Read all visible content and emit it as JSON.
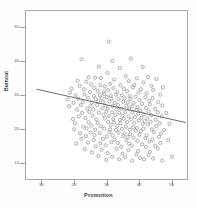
{
  "chart_data": {
    "type": "scatter",
    "title": "",
    "xlabel": "Promotion",
    "ylabel": "Burnout",
    "xlim": [
      5,
      55
    ],
    "ylim": [
      5,
      55
    ],
    "xticks": [
      10,
      20,
      30,
      40,
      50
    ],
    "yticks": [
      10,
      20,
      30,
      40,
      50
    ],
    "grid": false,
    "legend": null,
    "marker": "open-circle",
    "marker_color": "#8c8c8c",
    "trendline": {
      "type": "linear-fit",
      "color": "#6e6e6e",
      "x_start": 8.2,
      "y_start": 32.0,
      "x_end": 54.0,
      "y_end": 22.2
    },
    "points": [
      [
        30.4,
        46.0
      ],
      [
        22.0,
        40.8
      ],
      [
        31.5,
        40.3
      ],
      [
        37.2,
        41.0
      ],
      [
        27.3,
        38.6
      ],
      [
        33.8,
        38.2
      ],
      [
        40.8,
        38.5
      ],
      [
        30.0,
        36.8
      ],
      [
        24.2,
        35.5
      ],
      [
        26.2,
        35.4
      ],
      [
        28.0,
        35.3
      ],
      [
        35.6,
        35.8
      ],
      [
        39.0,
        35.2
      ],
      [
        42.4,
        35.6
      ],
      [
        45.0,
        35.0
      ],
      [
        20.8,
        34.5
      ],
      [
        23.5,
        34.2
      ],
      [
        32.0,
        34.8
      ],
      [
        36.5,
        34.4
      ],
      [
        41.0,
        34.0
      ],
      [
        21.5,
        33.0
      ],
      [
        25.0,
        33.4
      ],
      [
        27.8,
        33.2
      ],
      [
        30.8,
        33.6
      ],
      [
        34.0,
        33.1
      ],
      [
        38.2,
        33.3
      ],
      [
        43.5,
        33.0
      ],
      [
        47.0,
        32.5
      ],
      [
        19.0,
        32.2
      ],
      [
        22.8,
        32.0
      ],
      [
        26.0,
        32.4
      ],
      [
        29.2,
        32.8
      ],
      [
        31.8,
        32.3
      ],
      [
        35.0,
        32.1
      ],
      [
        37.8,
        32.6
      ],
      [
        40.2,
        32.0
      ],
      [
        44.0,
        31.8
      ],
      [
        18.5,
        31.0
      ],
      [
        24.6,
        31.2
      ],
      [
        27.0,
        31.5
      ],
      [
        28.8,
        31.3
      ],
      [
        30.2,
        31.7
      ],
      [
        33.0,
        31.1
      ],
      [
        36.0,
        31.4
      ],
      [
        39.5,
        31.0
      ],
      [
        42.0,
        30.8
      ],
      [
        46.2,
        30.4
      ],
      [
        20.2,
        30.2
      ],
      [
        23.0,
        30.5
      ],
      [
        25.8,
        30.0
      ],
      [
        27.6,
        30.3
      ],
      [
        29.0,
        30.6
      ],
      [
        31.0,
        30.1
      ],
      [
        32.6,
        30.4
      ],
      [
        34.4,
        30.2
      ],
      [
        36.8,
        30.0
      ],
      [
        38.6,
        29.8
      ],
      [
        41.6,
        29.6
      ],
      [
        43.8,
        29.4
      ],
      [
        17.8,
        29.0
      ],
      [
        21.0,
        29.2
      ],
      [
        24.0,
        29.5
      ],
      [
        26.4,
        29.1
      ],
      [
        28.2,
        29.4
      ],
      [
        29.8,
        29.7
      ],
      [
        31.2,
        29.2
      ],
      [
        33.4,
        29.0
      ],
      [
        35.2,
        29.3
      ],
      [
        37.0,
        29.1
      ],
      [
        39.8,
        28.8
      ],
      [
        42.8,
        28.6
      ],
      [
        45.6,
        28.2
      ],
      [
        19.6,
        28.0
      ],
      [
        22.4,
        28.3
      ],
      [
        25.2,
        28.1
      ],
      [
        27.2,
        28.5
      ],
      [
        28.6,
        28.2
      ],
      [
        30.6,
        28.4
      ],
      [
        32.2,
        28.0
      ],
      [
        34.8,
        28.3
      ],
      [
        36.2,
        28.1
      ],
      [
        38.0,
        27.9
      ],
      [
        40.6,
        27.7
      ],
      [
        43.0,
        27.5
      ],
      [
        46.8,
        27.2
      ],
      [
        18.2,
        27.0
      ],
      [
        21.8,
        27.3
      ],
      [
        24.8,
        27.1
      ],
      [
        26.8,
        27.4
      ],
      [
        29.4,
        27.2
      ],
      [
        31.6,
        27.0
      ],
      [
        33.2,
        27.3
      ],
      [
        35.8,
        27.1
      ],
      [
        37.4,
        26.9
      ],
      [
        39.2,
        26.7
      ],
      [
        41.8,
        26.5
      ],
      [
        44.6,
        26.2
      ],
      [
        20.6,
        26.0
      ],
      [
        23.8,
        26.3
      ],
      [
        25.6,
        26.1
      ],
      [
        28.4,
        26.4
      ],
      [
        30.0,
        26.2
      ],
      [
        32.8,
        26.0
      ],
      [
        34.2,
        26.3
      ],
      [
        36.6,
        26.1
      ],
      [
        38.8,
        25.9
      ],
      [
        40.0,
        25.7
      ],
      [
        42.6,
        25.5
      ],
      [
        45.4,
        25.2
      ],
      [
        48.0,
        25.0
      ],
      [
        22.2,
        25.0
      ],
      [
        24.4,
        25.3
      ],
      [
        27.4,
        25.1
      ],
      [
        29.6,
        25.4
      ],
      [
        31.4,
        25.2
      ],
      [
        33.6,
        25.0
      ],
      [
        35.4,
        25.3
      ],
      [
        37.6,
        25.1
      ],
      [
        39.4,
        24.8
      ],
      [
        41.2,
        24.6
      ],
      [
        43.4,
        24.4
      ],
      [
        46.6,
        24.0
      ],
      [
        21.2,
        24.0
      ],
      [
        25.4,
        24.2
      ],
      [
        28.8,
        24.5
      ],
      [
        30.4,
        24.1
      ],
      [
        32.4,
        24.4
      ],
      [
        34.6,
        24.2
      ],
      [
        36.4,
        24.0
      ],
      [
        38.4,
        23.8
      ],
      [
        40.4,
        23.6
      ],
      [
        42.2,
        23.4
      ],
      [
        44.8,
        23.0
      ],
      [
        19.4,
        23.2
      ],
      [
        23.2,
        23.5
      ],
      [
        26.6,
        23.1
      ],
      [
        29.2,
        23.4
      ],
      [
        31.8,
        23.2
      ],
      [
        33.8,
        23.0
      ],
      [
        35.0,
        23.3
      ],
      [
        37.2,
        23.1
      ],
      [
        39.6,
        22.8
      ],
      [
        41.4,
        22.6
      ],
      [
        43.2,
        22.4
      ],
      [
        46.0,
        22.0
      ],
      [
        49.0,
        21.8
      ],
      [
        20.0,
        22.0
      ],
      [
        24.2,
        22.3
      ],
      [
        27.0,
        22.1
      ],
      [
        30.2,
        22.4
      ],
      [
        32.0,
        22.2
      ],
      [
        34.0,
        22.0
      ],
      [
        36.0,
        22.3
      ],
      [
        38.2,
        22.1
      ],
      [
        40.8,
        21.8
      ],
      [
        42.4,
        21.6
      ],
      [
        45.0,
        21.2
      ],
      [
        22.6,
        21.0
      ],
      [
        25.0,
        21.3
      ],
      [
        28.0,
        21.1
      ],
      [
        31.0,
        21.4
      ],
      [
        33.0,
        21.2
      ],
      [
        35.6,
        21.0
      ],
      [
        37.8,
        20.8
      ],
      [
        39.0,
        20.6
      ],
      [
        41.0,
        20.4
      ],
      [
        43.6,
        20.2
      ],
      [
        47.4,
        20.0
      ],
      [
        19.8,
        20.2
      ],
      [
        23.6,
        20.5
      ],
      [
        26.2,
        20.1
      ],
      [
        29.0,
        20.4
      ],
      [
        30.8,
        20.2
      ],
      [
        32.6,
        20.0
      ],
      [
        34.4,
        20.3
      ],
      [
        36.8,
        20.1
      ],
      [
        38.6,
        19.8
      ],
      [
        40.2,
        19.6
      ],
      [
        44.2,
        19.4
      ],
      [
        46.4,
        19.0
      ],
      [
        21.6,
        19.0
      ],
      [
        24.8,
        19.3
      ],
      [
        27.6,
        19.1
      ],
      [
        30.6,
        19.4
      ],
      [
        33.4,
        19.2
      ],
      [
        35.2,
        19.0
      ],
      [
        37.0,
        18.8
      ],
      [
        39.8,
        18.6
      ],
      [
        42.0,
        18.4
      ],
      [
        45.8,
        18.0
      ],
      [
        23.4,
        18.2
      ],
      [
        26.0,
        18.5
      ],
      [
        29.8,
        18.1
      ],
      [
        31.6,
        18.4
      ],
      [
        34.8,
        18.2
      ],
      [
        36.2,
        18.0
      ],
      [
        38.0,
        17.8
      ],
      [
        41.6,
        17.6
      ],
      [
        43.8,
        17.2
      ],
      [
        48.6,
        17.0
      ],
      [
        22.0,
        17.4
      ],
      [
        25.8,
        17.1
      ],
      [
        28.6,
        17.4
      ],
      [
        32.2,
        17.2
      ],
      [
        35.8,
        17.0
      ],
      [
        39.2,
        16.8
      ],
      [
        42.8,
        16.6
      ],
      [
        46.2,
        16.2
      ],
      [
        20.4,
        16.0
      ],
      [
        24.0,
        16.3
      ],
      [
        27.8,
        16.1
      ],
      [
        31.2,
        16.4
      ],
      [
        33.2,
        16.2
      ],
      [
        36.6,
        16.0
      ],
      [
        40.6,
        15.8
      ],
      [
        44.6,
        15.4
      ],
      [
        26.4,
        15.2
      ],
      [
        29.4,
        15.5
      ],
      [
        34.2,
        15.1
      ],
      [
        37.4,
        15.4
      ],
      [
        41.8,
        15.0
      ],
      [
        45.4,
        14.6
      ],
      [
        23.0,
        14.4
      ],
      [
        28.2,
        14.2
      ],
      [
        32.8,
        14.5
      ],
      [
        36.4,
        14.1
      ],
      [
        39.4,
        13.8
      ],
      [
        43.0,
        13.6
      ],
      [
        25.2,
        13.4
      ],
      [
        30.0,
        13.2
      ],
      [
        34.6,
        13.0
      ],
      [
        38.8,
        12.8
      ],
      [
        42.6,
        12.6
      ],
      [
        49.8,
        12.2
      ],
      [
        27.2,
        12.4
      ],
      [
        31.4,
        12.1
      ],
      [
        35.4,
        12.0
      ],
      [
        40.0,
        11.8
      ],
      [
        44.0,
        11.6
      ],
      [
        33.6,
        11.4
      ],
      [
        29.6,
        11.2
      ],
      [
        37.6,
        11.0
      ],
      [
        41.2,
        11.4
      ],
      [
        46.8,
        11.0
      ]
    ]
  }
}
